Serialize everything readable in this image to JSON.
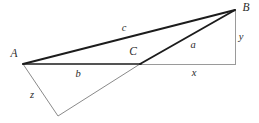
{
  "figure": {
    "width": 259,
    "height": 123,
    "background": "#ffffff",
    "colors": {
      "thick_stroke": "#1c1c1c",
      "thin_stroke": "#8a8a8a",
      "light_stroke": "#9a9a9a",
      "label_text": "#2b2b2b"
    },
    "vertices": [
      {
        "name": "A",
        "label": "A",
        "x": 23,
        "y": 64,
        "label_x": 14,
        "label_y": 54
      },
      {
        "name": "B",
        "label": "B",
        "x": 235,
        "y": 10,
        "label_x": 246,
        "label_y": 8
      },
      {
        "name": "C",
        "label": "C",
        "x": 140,
        "y": 64,
        "label_x": 133,
        "label_y": 52
      },
      {
        "name": "D",
        "label": "",
        "x": 58,
        "y": 116,
        "label_x": 58,
        "label_y": 116
      },
      {
        "name": "F",
        "label": "",
        "x": 235,
        "y": 64,
        "label_x": 235,
        "label_y": 64
      }
    ],
    "edges": [
      {
        "name": "side-c",
        "from": "A",
        "to": "B",
        "weight": "thick",
        "x1": 23,
        "y1": 64,
        "x2": 235,
        "y2": 10
      },
      {
        "name": "side-b",
        "from": "A",
        "to": "C",
        "weight": "thick",
        "x1": 23,
        "y1": 64,
        "x2": 141,
        "y2": 64
      },
      {
        "name": "side-a",
        "from": "D",
        "to": "B",
        "weight": "thick",
        "x1": 58,
        "y1": 116,
        "x2": 235,
        "y2": 10
      },
      {
        "name": "side-z",
        "from": "A",
        "to": "D",
        "weight": "thin",
        "x1": 23,
        "y1": 64,
        "x2": 58,
        "y2": 116
      },
      {
        "name": "side-x",
        "from": "C",
        "to": "F",
        "weight": "light",
        "x1": 140,
        "y1": 64,
        "x2": 236,
        "y2": 64
      },
      {
        "name": "side-y",
        "from": "B",
        "to": "F",
        "weight": "light",
        "x1": 235,
        "y1": 11,
        "x2": 235,
        "y2": 64
      }
    ],
    "side_labels": [
      {
        "name": "label-c",
        "text": "c",
        "x": 124,
        "y": 28
      },
      {
        "name": "label-a",
        "text": "a",
        "x": 193,
        "y": 45
      },
      {
        "name": "label-b",
        "text": "b",
        "x": 78,
        "y": 74
      },
      {
        "name": "label-x",
        "text": "x",
        "x": 194,
        "y": 73
      },
      {
        "name": "label-y",
        "text": "y",
        "x": 241,
        "y": 37
      },
      {
        "name": "label-z",
        "text": "z",
        "x": 32,
        "y": 95
      }
    ]
  }
}
